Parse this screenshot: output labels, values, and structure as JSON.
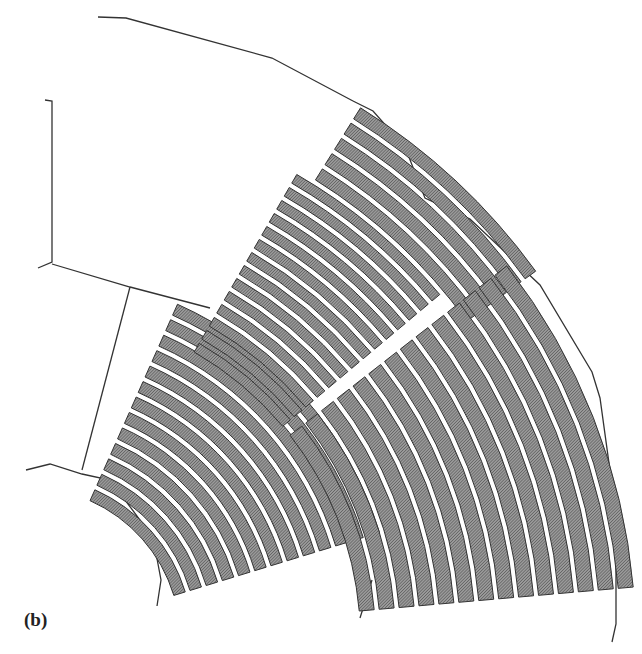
{
  "figure": {
    "label": "(b)",
    "colors": {
      "outline": "#333333",
      "seat_fill": "#8a8a8a",
      "seat_hatch": "#555555",
      "background": "#ffffff"
    }
  },
  "geometry": {
    "center": [
      28,
      640
    ],
    "blocks": [
      {
        "name": "inner-left-block",
        "rows": 13,
        "r_inner": 150,
        "r_outer": 370,
        "a_start": 17,
        "a_end": 66
      },
      {
        "name": "upper-middle-block",
        "rows": 14,
        "r_inner": 330,
        "r_outer": 540,
        "a_start": 40,
        "a_end": 60
      },
      {
        "name": "upper-rear-block",
        "rows": 5,
        "r_inner": 540,
        "r_outer": 630,
        "a_start": 36,
        "a_end": 58
      },
      {
        "name": "lower-right-block",
        "rows": 14,
        "r_inner": 330,
        "r_outer": 610,
        "a_start": 5,
        "a_end": 38
      }
    ]
  }
}
